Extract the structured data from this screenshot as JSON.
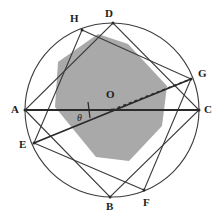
{
  "figure": {
    "canvas": {
      "width": 220,
      "height": 221
    },
    "circle": {
      "cx": 112,
      "cy": 110,
      "r": 87,
      "stroke": "#3c3c3c",
      "stroke_width": 1.1
    },
    "colors": {
      "shade_fill": "#a9a9a9",
      "stroke": "#3c3c3c",
      "heavy_stroke": "#2a2a2a",
      "label_text": "#1d1d1d",
      "background": "#ffffff"
    },
    "vertices": [
      {
        "id": "A",
        "label": "A",
        "x": 25,
        "y": 110,
        "label_x": 11,
        "label_y": 104,
        "on_circle": true
      },
      {
        "id": "B",
        "label": "B",
        "x": 110,
        "y": 197,
        "label_x": 106,
        "label_y": 201,
        "on_circle": true
      },
      {
        "id": "C",
        "label": "C",
        "x": 199,
        "y": 110,
        "label_x": 204,
        "label_y": 104,
        "on_circle": true
      },
      {
        "id": "D",
        "label": "D",
        "x": 113,
        "y": 23,
        "label_x": 105,
        "label_y": 8,
        "on_circle": true
      },
      {
        "id": "E",
        "label": "E",
        "x": 34,
        "y": 143,
        "label_x": 19,
        "label_y": 139,
        "on_circle": true
      },
      {
        "id": "F",
        "label": "F",
        "x": 144,
        "y": 190,
        "label_x": 143,
        "label_y": 197,
        "on_circle": true
      },
      {
        "id": "G",
        "label": "G",
        "x": 191,
        "y": 79,
        "label_x": 198,
        "label_y": 68,
        "on_circle": true
      },
      {
        "id": "H",
        "label": "H",
        "x": 82,
        "y": 30,
        "label_x": 70,
        "label_y": 13,
        "on_circle": true
      }
    ],
    "quadrilateral_1": {
      "name": "ABCD",
      "vertex_ids": [
        "A",
        "B",
        "C",
        "D"
      ],
      "points": "25,110 110,197 199,110 113,23"
    },
    "quadrilateral_2": {
      "name": "EFGH",
      "vertex_ids": [
        "E",
        "F",
        "G",
        "H"
      ],
      "points": "34,143 144,190 191,79 82,30"
    },
    "shaded_octagon": {
      "label": "intersection region",
      "points": "58,62 98,34 128,44 167,86 162,126 129,161 96,157 55,107",
      "fill": "#a9a9a9"
    },
    "diameter_AC": {
      "label": "AC",
      "x1": 25,
      "y1": 110,
      "x2": 199,
      "y2": 110
    },
    "chord_EG": {
      "label": "EG",
      "x1": 34,
      "y1": 143,
      "x2": 191,
      "y2": 79
    },
    "radius_OG_dashed": {
      "label": "OG",
      "x1": 112,
      "y1": 110,
      "x2": 191,
      "y2": 79,
      "dash": "3,3"
    },
    "center": {
      "id": "O",
      "label": "O",
      "x": 112,
      "y": 110,
      "label_x": 106,
      "label_y": 89
    },
    "angle_marker": {
      "label": "θ",
      "label_x": 77,
      "label_y": 113,
      "arc_radius": 42,
      "description": "angle theta between diameter AC and chord EG at center O"
    },
    "tick_mark": {
      "x1": 88,
      "y1": 102,
      "x2": 90,
      "y2": 118,
      "description": "short tick across chord EG near angle arc"
    }
  }
}
